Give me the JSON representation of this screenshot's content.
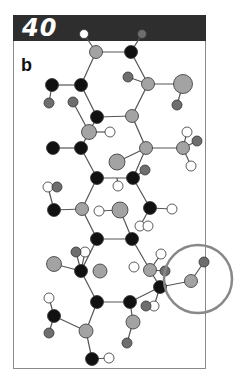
{
  "figure": {
    "number": "40",
    "panel_label": "b",
    "colors": {
      "header_bg": "#2e2e2e",
      "frame": "#8a8a8a",
      "bond": "#555555",
      "atom_black": "#111111",
      "atom_gray": "#a3a3a3",
      "atom_darkgray": "#6e6e6e",
      "atom_white": "#ffffff",
      "highlight_circle": "#888888"
    },
    "highlight": {
      "cx": 198,
      "cy": 279,
      "r": 34
    }
  }
}
